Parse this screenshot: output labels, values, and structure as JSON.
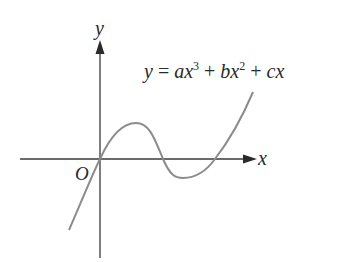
{
  "diagram": {
    "equation": {
      "y": "y",
      "eq": " = ",
      "a": "ax",
      "exp3": "3",
      "plus1": " + ",
      "b": "bx",
      "exp2": "2",
      "plus2": " + ",
      "c": "cx"
    },
    "axes": {
      "x_label": "x",
      "y_label": "y",
      "origin_label": "O"
    },
    "curve": {
      "description": "cubic passing through origin with local max then local min, crossing x-axis at three points",
      "color": "#8c8c8c"
    },
    "colors": {
      "axis": "#3a3a3a",
      "curve": "#8c8c8c",
      "text": "#2a2a2a"
    }
  }
}
